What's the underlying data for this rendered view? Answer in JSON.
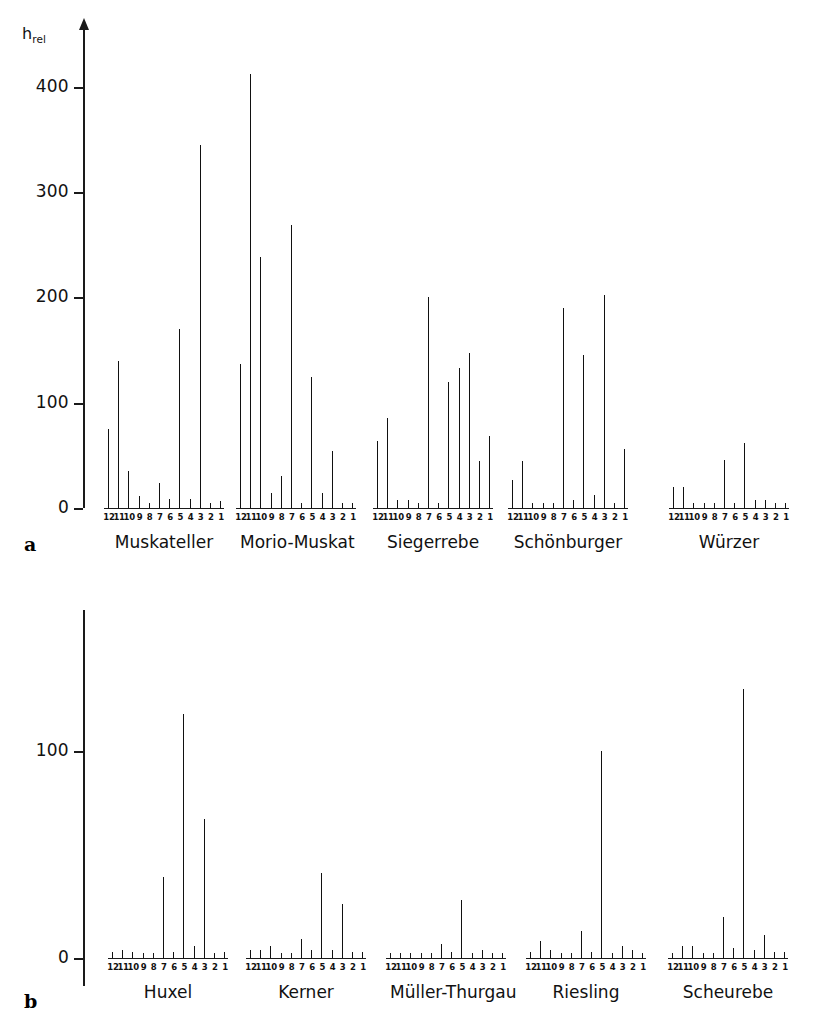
{
  "figure": {
    "yaxis_title": "h",
    "yaxis_title_sub": "rel"
  },
  "panels": [
    {
      "letter": "a",
      "y_ticks": [
        0,
        100,
        200,
        300,
        400
      ],
      "y_max": 430,
      "groups": [
        {
          "name": "Muskateller",
          "categories": [
            "12",
            "11",
            "10",
            "9",
            "8",
            "7",
            "6",
            "5",
            "4",
            "3",
            "2",
            "1"
          ],
          "values": [
            75,
            140,
            35,
            11,
            4,
            24,
            9,
            170,
            9,
            345,
            5,
            7
          ]
        },
        {
          "name": "Morio-Muskat",
          "categories": [
            "12",
            "11",
            "10",
            "9",
            "8",
            "7",
            "6",
            "5",
            "4",
            "3",
            "2",
            "1"
          ],
          "values": [
            137,
            412,
            238,
            14,
            30,
            269,
            3,
            124,
            14,
            54,
            5,
            5
          ]
        },
        {
          "name": "Siegerrebe",
          "categories": [
            "12",
            "11",
            "10",
            "9",
            "8",
            "7",
            "6",
            "5",
            "4",
            "3",
            "2",
            "1"
          ],
          "values": [
            64,
            85,
            8,
            8,
            3,
            200,
            5,
            120,
            133,
            147,
            45,
            68
          ]
        },
        {
          "name": "Schönburger",
          "categories": [
            "12",
            "11",
            "10",
            "9",
            "8",
            "7",
            "6",
            "5",
            "4",
            "3",
            "2",
            "1"
          ],
          "values": [
            27,
            45,
            4,
            4,
            4,
            190,
            8,
            145,
            12,
            202,
            4,
            56
          ]
        },
        {
          "name": "Würzer",
          "categories": [
            "12",
            "11",
            "10",
            "9",
            "8",
            "7",
            "6",
            "5",
            "4",
            "3",
            "2",
            "1"
          ],
          "values": [
            20,
            20,
            5,
            0,
            0,
            46,
            5,
            62,
            8,
            8,
            0,
            5
          ]
        }
      ]
    },
    {
      "letter": "b",
      "y_ticks": [
        0,
        100
      ],
      "y_max": 150,
      "groups": [
        {
          "name": "Huxel",
          "categories": [
            "12",
            "11",
            "10",
            "9",
            "8",
            "7",
            "6",
            "5",
            "4",
            "3",
            "2",
            "1"
          ],
          "values": [
            3,
            4,
            3,
            0,
            0,
            39,
            3,
            118,
            6,
            67,
            2,
            3
          ]
        },
        {
          "name": "Kerner",
          "categories": [
            "12",
            "11",
            "10",
            "9",
            "8",
            "7",
            "6",
            "5",
            "4",
            "3",
            "2",
            "1"
          ],
          "values": [
            4,
            4,
            6,
            0,
            0,
            9,
            4,
            41,
            4,
            26,
            3,
            3
          ]
        },
        {
          "name": "Müller-Thurgau",
          "categories": [
            "12",
            "11",
            "10",
            "9",
            "8",
            "7",
            "6",
            "5",
            "4",
            "3",
            "2",
            "1"
          ],
          "values": [
            0,
            0,
            0,
            0,
            0,
            7,
            3,
            28,
            0,
            4,
            2,
            2
          ]
        },
        {
          "name": "Riesling",
          "categories": [
            "12",
            "11",
            "10",
            "9",
            "8",
            "7",
            "6",
            "5",
            "4",
            "3",
            "2",
            "1"
          ],
          "values": [
            3,
            8,
            4,
            2,
            0,
            13,
            3,
            100,
            0,
            6,
            4,
            2
          ]
        },
        {
          "name": "Scheurebe",
          "categories": [
            "12",
            "11",
            "10",
            "9",
            "8",
            "7",
            "6",
            "5",
            "4",
            "3",
            "2",
            "1"
          ],
          "values": [
            1,
            6,
            6,
            2,
            0,
            20,
            5,
            130,
            4,
            11,
            3,
            3
          ]
        }
      ]
    }
  ],
  "chart_data": {
    "type": "bar",
    "title": "",
    "xlabel": "",
    "ylabel": "h_rel",
    "grid": false,
    "legend": "none",
    "panels": [
      {
        "id": "a",
        "ylim": [
          0,
          430
        ],
        "yticks": [
          0,
          100,
          200,
          300,
          400
        ],
        "categories": [
          "12",
          "11",
          "10",
          "9",
          "8",
          "7",
          "6",
          "5",
          "4",
          "3",
          "2",
          "1"
        ],
        "series": [
          {
            "name": "Muskateller",
            "values": [
              75,
              140,
              35,
              11,
              4,
              24,
              9,
              170,
              9,
              345,
              5,
              7
            ]
          },
          {
            "name": "Morio-Muskat",
            "values": [
              137,
              412,
              238,
              14,
              30,
              269,
              3,
              124,
              14,
              54,
              5,
              5
            ]
          },
          {
            "name": "Siegerrebe",
            "values": [
              64,
              85,
              8,
              8,
              3,
              200,
              5,
              120,
              133,
              147,
              45,
              68
            ]
          },
          {
            "name": "Schönburger",
            "values": [
              27,
              45,
              4,
              4,
              4,
              190,
              8,
              145,
              12,
              202,
              4,
              56
            ]
          },
          {
            "name": "Würzer",
            "values": [
              20,
              20,
              5,
              0,
              0,
              46,
              5,
              62,
              8,
              8,
              0,
              5
            ]
          }
        ]
      },
      {
        "id": "b",
        "ylim": [
          0,
          150
        ],
        "yticks": [
          0,
          100
        ],
        "categories": [
          "12",
          "11",
          "10",
          "9",
          "8",
          "7",
          "6",
          "5",
          "4",
          "3",
          "2",
          "1"
        ],
        "series": [
          {
            "name": "Huxel",
            "values": [
              3,
              4,
              3,
              0,
              0,
              39,
              3,
              118,
              6,
              67,
              2,
              3
            ]
          },
          {
            "name": "Kerner",
            "values": [
              4,
              4,
              6,
              0,
              0,
              9,
              4,
              41,
              4,
              26,
              3,
              3
            ]
          },
          {
            "name": "Müller-Thurgau",
            "values": [
              0,
              0,
              0,
              0,
              0,
              7,
              3,
              28,
              0,
              4,
              2,
              2
            ]
          },
          {
            "name": "Riesling",
            "values": [
              3,
              8,
              4,
              2,
              0,
              13,
              3,
              100,
              0,
              6,
              4,
              2
            ]
          },
          {
            "name": "Scheurebe",
            "values": [
              1,
              6,
              6,
              2,
              0,
              20,
              5,
              130,
              4,
              11,
              3,
              3
            ]
          }
        ]
      }
    ]
  },
  "colors": {
    "ink": "#111111",
    "background": "#ffffff"
  }
}
